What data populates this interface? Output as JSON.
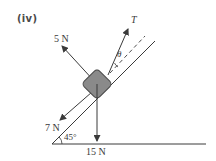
{
  "figure": {
    "part_label": "(iv)",
    "forces": {
      "tension": {
        "label": "T"
      },
      "normal": {
        "label": "5 N"
      },
      "friction_down_slope": {
        "label": "7 N"
      },
      "weight": {
        "label": "15 N"
      }
    },
    "angles": {
      "incline": {
        "label": "45°"
      },
      "tension_angle": {
        "label": "θ"
      }
    },
    "colors": {
      "line": "#3a3a3a",
      "block_fill": "#8a8a8a",
      "block_stroke": "#4a4a4a",
      "background": "#ffffff"
    }
  }
}
